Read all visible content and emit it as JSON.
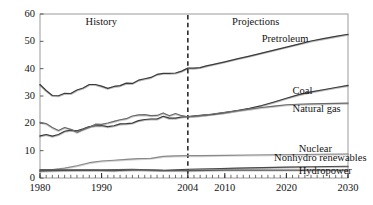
{
  "chart_data": {
    "type": "line",
    "title": "",
    "xlabel": "",
    "ylabel": "",
    "xlim": [
      1980,
      2030
    ],
    "ylim": [
      0,
      60
    ],
    "grid": false,
    "legend_position": "inline-right",
    "y_ticks": [
      0,
      10,
      20,
      30,
      40,
      50,
      60
    ],
    "x_ticks": [
      1980,
      1990,
      2004,
      2010,
      2020,
      2030
    ],
    "x_tick_labels": [
      "1980",
      "1990",
      "2004",
      "2010",
      "2020",
      "2030"
    ],
    "y_tick_labels": [
      "0",
      "10",
      "20",
      "30",
      "40",
      "50",
      "60"
    ],
    "minor_tick_interval": 1,
    "annotations": [
      {
        "text": "History",
        "x": 1990,
        "y": 57,
        "name": "history-label"
      },
      {
        "text": "Projections",
        "x": 2015,
        "y": 57,
        "name": "projections-label"
      }
    ],
    "divider": {
      "x": 2004,
      "style": "dashed",
      "label": "2004"
    },
    "series": [
      {
        "name": "Pretroleum",
        "label_x": 2016,
        "label_y": 50.5,
        "color": "#3c3c3c",
        "x": [
          1980,
          1981,
          1982,
          1983,
          1984,
          1985,
          1986,
          1987,
          1988,
          1989,
          1990,
          1991,
          1992,
          1993,
          1994,
          1995,
          1996,
          1997,
          1998,
          1999,
          2000,
          2001,
          2002,
          2003,
          2004,
          2005,
          2006,
          2007,
          2008,
          2010,
          2012,
          2014,
          2016,
          2018,
          2020,
          2022,
          2024,
          2026,
          2028,
          2030
        ],
        "values": [
          34.2,
          32.0,
          30.2,
          30.1,
          31.0,
          30.9,
          32.2,
          32.9,
          34.2,
          34.2,
          33.6,
          32.8,
          33.5,
          33.8,
          34.7,
          34.6,
          35.8,
          36.3,
          36.8,
          37.9,
          38.3,
          38.3,
          38.4,
          39.1,
          40.2,
          40.2,
          40.4,
          41.0,
          41.5,
          42.5,
          43.6,
          44.6,
          45.7,
          46.8,
          47.9,
          49.0,
          50.1,
          51.0,
          51.8,
          52.6
        ]
      },
      {
        "name": "Coal",
        "label_x": 2021,
        "label_y": 31.5,
        "color": "#3c3c3c",
        "x": [
          1980,
          1981,
          1982,
          1983,
          1984,
          1985,
          1986,
          1987,
          1988,
          1989,
          1990,
          1991,
          1992,
          1993,
          1994,
          1995,
          1996,
          1997,
          1998,
          1999,
          2000,
          2001,
          2002,
          2003,
          2004,
          2006,
          2008,
          2010,
          2012,
          2014,
          2016,
          2018,
          2020,
          2022,
          2024,
          2026,
          2028,
          2030
        ],
        "values": [
          15.4,
          15.9,
          15.3,
          15.9,
          17.1,
          17.5,
          17.3,
          18.0,
          18.8,
          19.1,
          19.2,
          18.8,
          19.1,
          19.8,
          19.9,
          20.1,
          21.0,
          21.4,
          21.6,
          21.6,
          22.6,
          21.9,
          21.9,
          22.3,
          22.5,
          22.9,
          23.3,
          23.9,
          24.7,
          25.5,
          26.5,
          27.8,
          29.2,
          30.5,
          31.5,
          32.3,
          33.1,
          33.9
        ]
      },
      {
        "name": "Natural gas",
        "label_x": 2021,
        "label_y": 25.0,
        "color": "#6b6b6b",
        "x": [
          1980,
          1981,
          1982,
          1983,
          1984,
          1985,
          1986,
          1987,
          1988,
          1989,
          1990,
          1991,
          1992,
          1993,
          1994,
          1995,
          1996,
          1997,
          1998,
          1999,
          2000,
          2001,
          2002,
          2003,
          2004,
          2006,
          2008,
          2010,
          2012,
          2014,
          2016,
          2018,
          2020,
          2022,
          2024,
          2026,
          2028,
          2030
        ],
        "values": [
          20.4,
          19.9,
          18.5,
          17.4,
          18.5,
          17.8,
          16.7,
          17.7,
          18.6,
          19.7,
          19.6,
          20.1,
          20.7,
          21.3,
          21.7,
          22.7,
          23.1,
          23.2,
          22.8,
          22.9,
          23.8,
          22.8,
          23.6,
          22.8,
          22.4,
          22.8,
          23.4,
          24.0,
          24.6,
          25.2,
          25.8,
          26.3,
          26.8,
          27.0,
          27.1,
          27.2,
          27.3,
          27.4
        ]
      },
      {
        "name": "Nuclear",
        "label_x": 2022,
        "label_y": 10.2,
        "color": "#8a8a8a",
        "x": [
          1980,
          1982,
          1984,
          1986,
          1988,
          1990,
          1992,
          1994,
          1996,
          1998,
          2000,
          2002,
          2004,
          2006,
          2010,
          2014,
          2018,
          2022,
          2026,
          2030
        ],
        "values": [
          2.7,
          3.1,
          3.6,
          4.5,
          5.6,
          6.2,
          6.5,
          6.8,
          7.1,
          7.2,
          7.9,
          8.1,
          8.2,
          8.2,
          8.3,
          8.4,
          8.5,
          8.6,
          8.7,
          8.8
        ]
      },
      {
        "name": "Nonhydro renewables",
        "label_x": 2018,
        "label_y": 7.0,
        "color": "#4a4a4a",
        "x": [
          1980,
          1984,
          1988,
          1992,
          1996,
          2000,
          2004,
          2008,
          2012,
          2016,
          2020,
          2024,
          2030
        ],
        "values": [
          2.6,
          2.8,
          2.9,
          2.7,
          3.0,
          2.8,
          3.2,
          3.4,
          3.6,
          3.8,
          4.0,
          4.1,
          4.3
        ]
      },
      {
        "name": "Hydropower",
        "label_x": 2022,
        "label_y": 2.2,
        "color": "#5a5a5a",
        "x": [
          1980,
          1985,
          1990,
          1995,
          2000,
          2004,
          2010,
          2015,
          2020,
          2025,
          2030
        ],
        "values": [
          3.1,
          3.0,
          3.0,
          3.2,
          2.8,
          2.7,
          2.9,
          2.9,
          2.9,
          2.9,
          2.9
        ]
      }
    ]
  }
}
